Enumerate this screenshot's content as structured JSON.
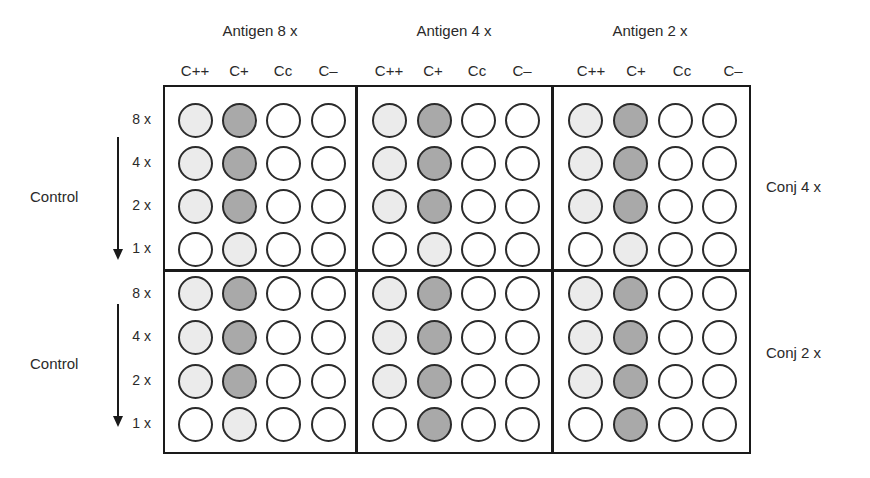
{
  "antigen_groups": [
    {
      "label": "Antigen 8 x",
      "columns": [
        "C++",
        "C+",
        "Cc",
        "C–"
      ]
    },
    {
      "label": "Antigen 4 x",
      "columns": [
        "C++",
        "C+",
        "Cc",
        "C–"
      ]
    },
    {
      "label": "Antigen 2 x",
      "columns": [
        "C++",
        "C+",
        "Cc",
        "C–"
      ]
    }
  ],
  "panels": [
    {
      "side_label": "Control",
      "conj_label": "Conj 4 x",
      "row_labels": [
        "8 x",
        "4 x",
        "2 x",
        "1 x"
      ],
      "wells": [
        [
          [
            "light",
            "dark",
            "white",
            "white"
          ],
          [
            "light",
            "dark",
            "white",
            "white"
          ],
          [
            "light",
            "dark",
            "white",
            "white"
          ]
        ],
        [
          [
            "light",
            "dark",
            "white",
            "white"
          ],
          [
            "light",
            "dark",
            "white",
            "white"
          ],
          [
            "light",
            "dark",
            "white",
            "white"
          ]
        ],
        [
          [
            "light",
            "dark",
            "white",
            "white"
          ],
          [
            "light",
            "dark",
            "white",
            "white"
          ],
          [
            "light",
            "dark",
            "white",
            "white"
          ]
        ],
        [
          [
            "white",
            "light",
            "white",
            "white"
          ],
          [
            "white",
            "light",
            "white",
            "white"
          ],
          [
            "white",
            "light",
            "white",
            "white"
          ]
        ]
      ]
    },
    {
      "side_label": "Control",
      "conj_label": "Conj 2 x",
      "row_labels": [
        "8 x",
        "4 x",
        "2 x",
        "1 x"
      ],
      "wells": [
        [
          [
            "light",
            "dark",
            "white",
            "white"
          ],
          [
            "light",
            "dark",
            "white",
            "white"
          ],
          [
            "light",
            "dark",
            "white",
            "white"
          ]
        ],
        [
          [
            "light",
            "dark",
            "white",
            "white"
          ],
          [
            "light",
            "dark",
            "white",
            "white"
          ],
          [
            "light",
            "dark",
            "white",
            "white"
          ]
        ],
        [
          [
            "light",
            "dark",
            "white",
            "white"
          ],
          [
            "light",
            "dark",
            "white",
            "white"
          ],
          [
            "light",
            "dark",
            "white",
            "white"
          ]
        ],
        [
          [
            "white",
            "light",
            "white",
            "white"
          ],
          [
            "white",
            "dark",
            "white",
            "white"
          ],
          [
            "white",
            "dark",
            "white",
            "white"
          ]
        ]
      ]
    }
  ],
  "colors": {
    "white": "#ffffff",
    "light": "#ebebeb",
    "dark": "#a9a9a9",
    "outline": "#2b2b2b"
  }
}
